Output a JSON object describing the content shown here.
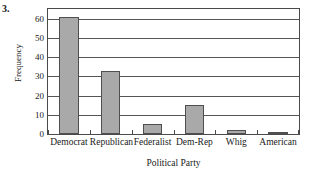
{
  "figure": {
    "problem_number": "3."
  },
  "chart_data": {
    "type": "bar",
    "title": "",
    "xlabel": "Political Party",
    "ylabel": "Frequency",
    "categories": [
      "Democrat",
      "Republican",
      "Federalist",
      "Dem-Rep",
      "Whig",
      "American"
    ],
    "values": [
      61,
      33,
      5,
      15,
      2,
      1
    ],
    "ylim": [
      0,
      65
    ],
    "yticks": [
      0,
      10,
      20,
      30,
      40,
      50,
      60
    ],
    "ytick_labels": [
      "0",
      "10",
      "20",
      "30",
      "40",
      "50",
      "60"
    ],
    "grid": "horizontal",
    "legend": "none",
    "bar_fill_color": "#a9a9a9",
    "bar_edge_color": "#4f4f4f",
    "axis_color": "#4a4a4a",
    "background_color": "#ffffff"
  }
}
